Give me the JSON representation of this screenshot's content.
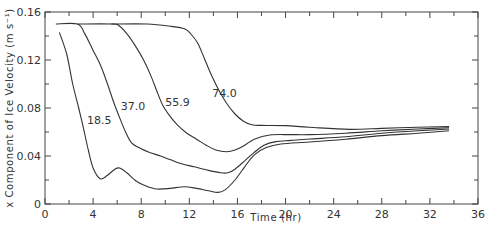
{
  "chart_data": {
    "type": "line",
    "title": "",
    "xlabel": "Time (hr)",
    "ylabel": "x Component of Ice Velocity (m s⁻¹)",
    "xlim": [
      0,
      36
    ],
    "ylim": [
      0,
      0.16
    ],
    "x_ticks": [
      0,
      4,
      8,
      12,
      16,
      20,
      24,
      28,
      32,
      36
    ],
    "x_tick_labels": [
      "0",
      "4",
      "8",
      "12",
      "16",
      "20",
      "24",
      "28",
      "32",
      "36"
    ],
    "y_ticks": [
      0,
      0.04,
      0.08,
      0.12,
      0.16
    ],
    "y_tick_labels": [
      "0",
      "0.04",
      "0.08",
      "0.12",
      "0.16"
    ],
    "x_minor_step": 2,
    "y_minor_step": 0.02,
    "grid": false,
    "legend": "inline curve labels",
    "series": [
      {
        "name": "18.5",
        "label_pos": [
          3.5,
          0.067
        ],
        "points": [
          [
            1.2,
            0.143
          ],
          [
            1.8,
            0.125
          ],
          [
            2.3,
            0.1
          ],
          [
            2.8,
            0.08
          ],
          [
            3.2,
            0.063
          ],
          [
            3.6,
            0.045
          ],
          [
            4.0,
            0.03
          ],
          [
            4.6,
            0.021
          ],
          [
            5.2,
            0.024
          ],
          [
            5.8,
            0.029
          ],
          [
            6.2,
            0.03
          ],
          [
            6.8,
            0.026
          ],
          [
            7.6,
            0.019
          ],
          [
            8.4,
            0.015
          ],
          [
            9.3,
            0.0125
          ],
          [
            10.4,
            0.013
          ],
          [
            11.6,
            0.0144
          ],
          [
            12.6,
            0.013
          ],
          [
            13.6,
            0.011
          ],
          [
            14.4,
            0.0097
          ],
          [
            15.0,
            0.012
          ],
          [
            15.8,
            0.02
          ],
          [
            16.6,
            0.031
          ],
          [
            17.4,
            0.041
          ],
          [
            18.4,
            0.047
          ],
          [
            19.6,
            0.05
          ],
          [
            22.0,
            0.0517
          ],
          [
            25.0,
            0.054
          ],
          [
            28.0,
            0.057
          ],
          [
            31.0,
            0.059
          ],
          [
            33.6,
            0.061
          ]
        ]
      },
      {
        "name": "37.0",
        "label_pos": [
          6.3,
          0.078
        ],
        "points": [
          [
            0.9,
            0.15
          ],
          [
            2.7,
            0.15
          ],
          [
            3.3,
            0.142
          ],
          [
            4.0,
            0.128
          ],
          [
            4.6,
            0.116
          ],
          [
            5.2,
            0.1
          ],
          [
            5.7,
            0.085
          ],
          [
            6.2,
            0.072
          ],
          [
            6.7,
            0.06
          ],
          [
            7.2,
            0.051
          ],
          [
            8.0,
            0.046
          ],
          [
            8.7,
            0.043
          ],
          [
            9.6,
            0.04
          ],
          [
            10.4,
            0.037
          ],
          [
            11.2,
            0.034
          ],
          [
            12.4,
            0.031
          ],
          [
            13.6,
            0.028
          ],
          [
            14.6,
            0.026
          ],
          [
            15.2,
            0.026
          ],
          [
            15.8,
            0.029
          ],
          [
            16.6,
            0.036
          ],
          [
            17.4,
            0.043
          ],
          [
            18.2,
            0.049
          ],
          [
            19.2,
            0.052
          ],
          [
            20.4,
            0.053
          ],
          [
            22.0,
            0.0542
          ],
          [
            25.0,
            0.056
          ],
          [
            28.0,
            0.059
          ],
          [
            31.0,
            0.061
          ],
          [
            33.6,
            0.0625
          ]
        ]
      },
      {
        "name": "55.9",
        "label_pos": [
          10.0,
          0.082
        ],
        "points": [
          [
            2.7,
            0.15
          ],
          [
            5.5,
            0.15
          ],
          [
            6.1,
            0.149
          ],
          [
            6.8,
            0.142
          ],
          [
            7.5,
            0.132
          ],
          [
            8.2,
            0.12
          ],
          [
            8.8,
            0.107
          ],
          [
            9.3,
            0.094
          ],
          [
            9.8,
            0.082
          ],
          [
            10.4,
            0.073
          ],
          [
            11.0,
            0.066
          ],
          [
            11.8,
            0.059
          ],
          [
            12.6,
            0.054
          ],
          [
            13.4,
            0.049
          ],
          [
            14.2,
            0.045
          ],
          [
            15.1,
            0.0436
          ],
          [
            15.8,
            0.045
          ],
          [
            16.6,
            0.049
          ],
          [
            17.4,
            0.054
          ],
          [
            18.7,
            0.0575
          ],
          [
            20.4,
            0.0578
          ],
          [
            22.0,
            0.0578
          ],
          [
            25.0,
            0.059
          ],
          [
            28.0,
            0.061
          ],
          [
            31.0,
            0.0625
          ],
          [
            33.6,
            0.0635
          ]
        ]
      },
      {
        "name": "74.0",
        "label_pos": [
          13.9,
          0.089
        ],
        "points": [
          [
            5.5,
            0.15
          ],
          [
            8.5,
            0.15
          ],
          [
            10.5,
            0.148
          ],
          [
            11.6,
            0.146
          ],
          [
            12.1,
            0.142
          ],
          [
            12.7,
            0.134
          ],
          [
            13.3,
            0.12
          ],
          [
            13.9,
            0.106
          ],
          [
            14.5,
            0.094
          ],
          [
            15.1,
            0.084
          ],
          [
            15.8,
            0.075
          ],
          [
            16.5,
            0.069
          ],
          [
            17.2,
            0.066
          ],
          [
            18.0,
            0.0655
          ],
          [
            20.0,
            0.0653
          ],
          [
            22.0,
            0.0639
          ],
          [
            25.3,
            0.0622
          ],
          [
            28.0,
            0.063
          ],
          [
            31.0,
            0.064
          ],
          [
            33.6,
            0.0645
          ]
        ]
      }
    ]
  }
}
